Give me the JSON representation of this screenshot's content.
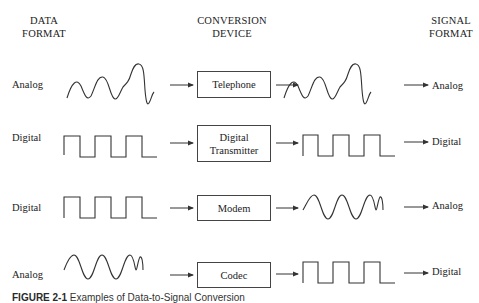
{
  "headers": {
    "data_format": [
      "DATA",
      "FORMAT"
    ],
    "conversion_device": [
      "CONVERSION",
      "DEVICE"
    ],
    "signal_format": [
      "SIGNAL",
      "FORMAT"
    ]
  },
  "rows": [
    {
      "data_format": "Analog",
      "input_wave": "irregular-analog",
      "device": [
        "Telephone"
      ],
      "output_wave": "irregular-analog",
      "signal_format": "Analog"
    },
    {
      "data_format": "Digital",
      "input_wave": "square",
      "device": [
        "Digital",
        "Transmitter"
      ],
      "output_wave": "square",
      "signal_format": "Digital"
    },
    {
      "data_format": "Digital",
      "input_wave": "square",
      "device": [
        "Modem"
      ],
      "output_wave": "sine",
      "signal_format": "Analog"
    },
    {
      "data_format": "Analog",
      "input_wave": "sine",
      "device": [
        "Codec"
      ],
      "output_wave": "square",
      "signal_format": "Digital"
    }
  ],
  "caption": {
    "label": "FIGURE 2-1",
    "text": "Examples of Data-to-Signal Conversion"
  },
  "colors": {
    "line": "#333333",
    "text": "#222222",
    "caption_label": "#2a2a2a"
  }
}
